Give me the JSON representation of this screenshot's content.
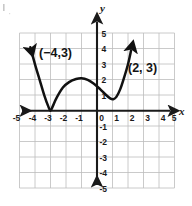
{
  "figure": {
    "title": "",
    "axis_label_x": "x",
    "axis_label_y": "y"
  },
  "axes": {
    "x_ticks": [
      "-5",
      "-4",
      "-3",
      "-2",
      "-1",
      "0",
      "1",
      "2",
      "3",
      "4",
      "5"
    ],
    "y_ticks": [
      "5",
      "4",
      "3",
      "2",
      "1",
      "-1",
      "-2",
      "-3",
      "-4",
      "-5"
    ],
    "x_range": [
      -5,
      5
    ],
    "y_range": [
      -5,
      5
    ],
    "grid": true,
    "grid_color": "#b9b9b9",
    "axis_color": "#1a1a1a"
  },
  "annotations": [
    {
      "id": "left-point",
      "text": "(−4,3)",
      "x": -4,
      "y": 3
    },
    {
      "id": "right-point",
      "text": "(2, 3)",
      "x": 2,
      "y": 3
    }
  ],
  "chart_data": {
    "type": "line",
    "title": "",
    "xlabel": "x",
    "ylabel": "y",
    "xlim": [
      -5,
      5
    ],
    "ylim": [
      -5,
      5
    ],
    "grid": true,
    "legend": null,
    "curve_color": "#111111",
    "series": [
      {
        "name": "quartic-curve",
        "arrow_start": true,
        "arrow_end": true,
        "points": [
          {
            "x": -4.3,
            "y": 4.1
          },
          {
            "x": -4.0,
            "y": 3.0
          },
          {
            "x": -3.7,
            "y": 2.0
          },
          {
            "x": -3.4,
            "y": 1.0
          },
          {
            "x": -3.15,
            "y": 0.3
          },
          {
            "x": -3.0,
            "y": 0.0
          },
          {
            "x": -2.85,
            "y": 0.3
          },
          {
            "x": -2.6,
            "y": 0.85
          },
          {
            "x": -2.2,
            "y": 1.5
          },
          {
            "x": -1.8,
            "y": 1.85
          },
          {
            "x": -1.35,
            "y": 2.05
          },
          {
            "x": -1.0,
            "y": 2.1
          },
          {
            "x": -0.6,
            "y": 2.0
          },
          {
            "x": -0.2,
            "y": 1.75
          },
          {
            "x": 0.2,
            "y": 1.4
          },
          {
            "x": 0.55,
            "y": 1.05
          },
          {
            "x": 0.85,
            "y": 0.8
          },
          {
            "x": 1.05,
            "y": 0.75
          },
          {
            "x": 1.25,
            "y": 0.9
          },
          {
            "x": 1.5,
            "y": 1.4
          },
          {
            "x": 1.75,
            "y": 2.15
          },
          {
            "x": 2.0,
            "y": 3.0
          },
          {
            "x": 2.2,
            "y": 3.9
          }
        ],
        "key_features": {
          "x_intercept_touch": {
            "x": -3,
            "y": 0
          },
          "local_max": {
            "x": -1,
            "y": 2.1
          },
          "local_min": {
            "x": 1.05,
            "y": 0.75
          },
          "labeled_points": [
            {
              "x": -4,
              "y": 3
            },
            {
              "x": 2,
              "y": 3
            }
          ]
        }
      }
    ]
  }
}
